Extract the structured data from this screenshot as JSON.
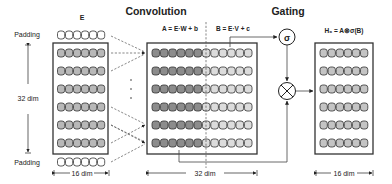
{
  "titles": {
    "convolution": "Convolution",
    "gating": "Gating"
  },
  "input": {
    "label": "E",
    "padding_top": "Padding",
    "padding_bottom": "Padding",
    "height_label": "32 dim",
    "width_label": "16 dim",
    "rows": 6,
    "cells_per_row": 6
  },
  "conv": {
    "eq_a": "A = E·W + b",
    "eq_b": "B = E·V + c",
    "width_label": "32 dim",
    "rows": 6,
    "cells_a": 6,
    "cells_b": 6
  },
  "gate": {
    "sigma_symbol": "σ",
    "multiply_symbol": "⊗"
  },
  "output": {
    "eq": "H₀ = A⊗σ(B)",
    "width_label": "16 dim",
    "rows": 6,
    "cells_per_row": 6
  },
  "colors": {
    "input_cell": "#b8b8b8",
    "padding_cell": "#ffffff",
    "conv_a_cell": "#8c8c8c",
    "conv_b_cell": "#dcdcdc",
    "output_cell": "#c4c4c4",
    "stroke": "#333333"
  }
}
